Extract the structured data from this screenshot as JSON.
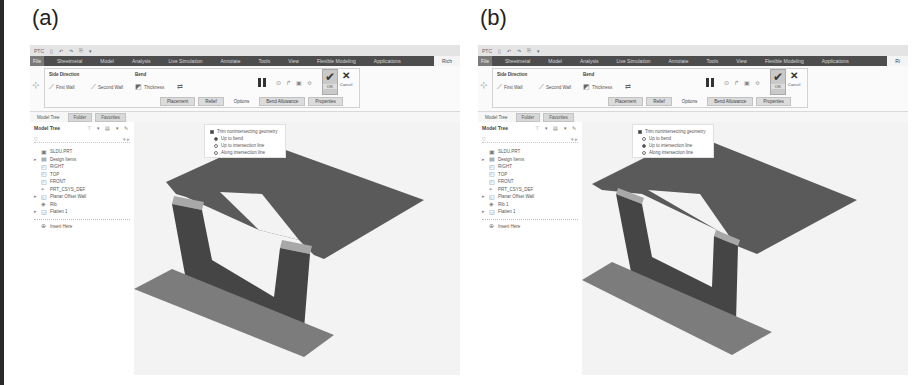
{
  "figure": {
    "panels": [
      {
        "label": "(a)",
        "app": {
          "quick_access": [
            "PTC",
            "▯",
            "↶",
            "↷",
            "⎘",
            "▾"
          ],
          "menu": {
            "file": "File",
            "items": [
              "Sheetmetal",
              "Model",
              "Analysis",
              "Live Simulation",
              "Annotate",
              "Tools",
              "View",
              "Flexible Modeling",
              "Applications"
            ],
            "active": "Rich"
          },
          "ribbon": {
            "group1_title": "Side Direction",
            "first_wall": "First Wall",
            "second_wall": "Second Wall",
            "group2_title": "Bend",
            "bend_value": "Thickness",
            "bend_flip": "⇄",
            "tool_icons": [
              "⊙",
              "↱",
              "▣",
              "≎"
            ],
            "ok": "OK",
            "cancel": "Cancel",
            "subtabs": [
              "Placement",
              "Relief",
              "Options",
              "Bend Allowance",
              "Properties"
            ],
            "active_subtab": 2
          },
          "nav_tabs": [
            "Model Tree",
            "Folder",
            "Favorites"
          ],
          "tree": {
            "title": "Model Tree",
            "tools": "⊤ ▾ ▤ ▾ ✎",
            "filter": "▽",
            "filter_right": "▾ ▸",
            "rows": [
              {
                "exp": "",
                "icon": "▣",
                "label": "SLDU.PRT"
              },
              {
                "exp": "▸",
                "icon": "▤",
                "label": "Design Items"
              },
              {
                "exp": "",
                "icon": "◰",
                "label": "RIGHT"
              },
              {
                "exp": "",
                "icon": "◰",
                "label": "TOP"
              },
              {
                "exp": "",
                "icon": "◰",
                "label": "FRONT"
              },
              {
                "exp": "",
                "icon": "⌖",
                "label": "PRT_CSYS_DEF"
              },
              {
                "exp": "▸",
                "icon": "◱",
                "label": "Planar Offset Wall"
              },
              {
                "exp": "",
                "icon": "◈",
                "label": "Rib"
              },
              {
                "exp": "▸",
                "icon": "◲",
                "label": "Flatten 1"
              }
            ],
            "after_sep": {
              "icon": "⊕",
              "label": "Insert Here"
            }
          },
          "popup": {
            "checkbox": "Trim nonintersecting geometry",
            "checkbox_checked": true,
            "radios": [
              "Up to bend",
              "Up to intersection line",
              "Along intersection line"
            ],
            "selected": 0
          }
        }
      },
      {
        "label": "(b)",
        "app": {
          "quick_access": [
            "PTC",
            "▯",
            "↶",
            "↷",
            "⎘",
            "▾"
          ],
          "menu": {
            "file": "File",
            "items": [
              "Sheetmetal",
              "Model",
              "Analysis",
              "Live Simulation",
              "Annotate",
              "Tools",
              "View",
              "Flexible Modeling",
              "Applications"
            ],
            "active": "Ri"
          },
          "ribbon": {
            "group1_title": "Side Direction",
            "first_wall": "First Wall",
            "second_wall": "Second Wall",
            "group2_title": "Bend",
            "bend_value": "Thickness",
            "bend_flip": "⇄",
            "tool_icons": [
              "⊙",
              "↱",
              "▣",
              "≎"
            ],
            "ok": "OK",
            "cancel": "Cancel",
            "subtabs": [
              "Placement",
              "Relief",
              "Options",
              "Bend Allowance",
              "Properties"
            ],
            "active_subtab": 2
          },
          "nav_tabs": [
            "Model Tree",
            "Folder",
            "Favorites"
          ],
          "tree": {
            "title": "Model Tree",
            "tools": "⊤ ▾ ▤ ▾ ✎",
            "filter": "▽",
            "filter_right": "▾ ▸",
            "rows": [
              {
                "exp": "",
                "icon": "▣",
                "label": "SLDU.PRT"
              },
              {
                "exp": "▸",
                "icon": "▤",
                "label": "Design Items"
              },
              {
                "exp": "",
                "icon": "◰",
                "label": "RIGHT"
              },
              {
                "exp": "",
                "icon": "◰",
                "label": "TOP"
              },
              {
                "exp": "",
                "icon": "◰",
                "label": "FRONT"
              },
              {
                "exp": "",
                "icon": "⌖",
                "label": "PRT_CSYS_DEF"
              },
              {
                "exp": "▸",
                "icon": "◱",
                "label": "Planar Offset Wall"
              },
              {
                "exp": "",
                "icon": "◈",
                "label": "Rib 1"
              },
              {
                "exp": "▸",
                "icon": "◲",
                "label": "Flatten 1"
              }
            ],
            "after_sep": {
              "icon": "⊕",
              "label": "Insert Here"
            }
          },
          "popup": {
            "checkbox": "Trim nonintersecting geometry",
            "checkbox_checked": true,
            "radios": [
              "Up to bend",
              "Up to intersection line",
              "Along intersection line"
            ],
            "selected": 1
          }
        }
      }
    ],
    "colors": {
      "top_plate": "#5a5a5a",
      "walls": "#454545",
      "base_plate": "#7c7c7c",
      "bend_highlight": "#a8a8a8",
      "menubar": "#4d4d4d"
    }
  }
}
